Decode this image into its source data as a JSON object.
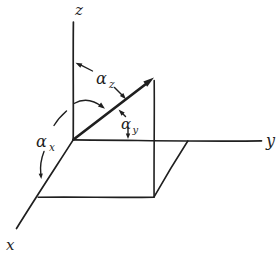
{
  "figure": {
    "background": "#ffffff",
    "ink": "#1f1f1f",
    "axes": {
      "z_label": "z",
      "y_label": "y",
      "x_label": "x"
    },
    "angles": {
      "alpha_z": {
        "symbol": "α",
        "subscript": "z"
      },
      "alpha_y": {
        "symbol": "α",
        "subscript": "y"
      },
      "alpha_x": {
        "symbol": "α",
        "subscript": "x"
      }
    }
  }
}
